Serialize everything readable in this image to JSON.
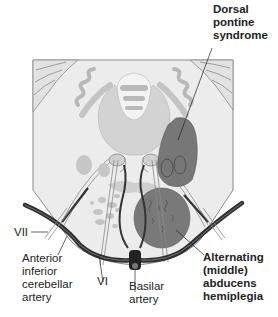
{
  "figure": {
    "colors": {
      "background": "#ffffff",
      "pons_fill": "#ececec",
      "pons_outline": "#8a8a8a",
      "nuclei_fill": "#c9c9c9",
      "ventricle_fill": "#d0d0d0",
      "lesion_dark": "#6e6e6e",
      "artery": "#333333",
      "label_text": "#222222"
    }
  },
  "labels": {
    "dorsal_pontine": [
      "Dorsal",
      "pontine",
      "syndrome"
    ],
    "alternating": [
      "Alternating",
      "(middle)",
      "abducens",
      "hemiplegia"
    ],
    "vii": "VII",
    "aica": [
      "Anterior",
      "inferior",
      "cerebellar",
      "artery"
    ],
    "vi": "VI",
    "basilar": [
      "Basilar",
      "artery"
    ]
  }
}
